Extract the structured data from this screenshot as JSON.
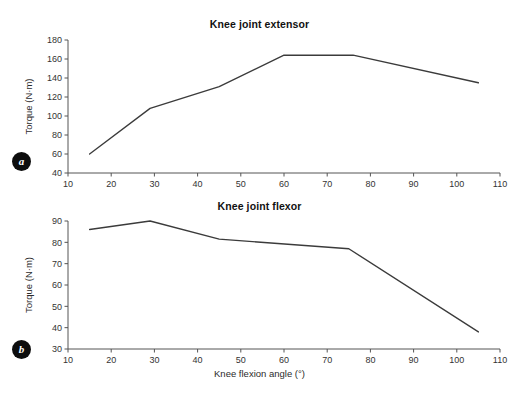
{
  "figure": {
    "background": "#ffffff",
    "line_color": "#3b3b3b",
    "axis_color": "#545454",
    "shared_xlabel": "Knee flexion angle (°)"
  },
  "panels": [
    {
      "id": "a",
      "badge": "a",
      "title": "Knee joint extensor"
    },
    {
      "id": "b",
      "badge": "b",
      "title": "Knee joint flexor"
    }
  ],
  "chart_data": [
    {
      "type": "line",
      "title": "Knee joint extensor",
      "panel_label": "a",
      "xlabel": "",
      "ylabel": "Torque (N·m)",
      "xlim": [
        10,
        110
      ],
      "ylim": [
        40,
        180
      ],
      "xticks": [
        10,
        20,
        30,
        40,
        50,
        60,
        70,
        80,
        90,
        100,
        110
      ],
      "yticks": [
        40,
        60,
        80,
        100,
        120,
        140,
        160,
        180
      ],
      "grid": false,
      "legend": "none",
      "series": [
        {
          "name": "Knee joint extensor torque",
          "x": [
            15,
            29,
            45,
            60,
            76,
            105
          ],
          "values": [
            60,
            108,
            131,
            164,
            164,
            135
          ]
        }
      ]
    },
    {
      "type": "line",
      "title": "Knee joint flexor",
      "panel_label": "b",
      "xlabel": "Knee flexion angle (°)",
      "ylabel": "Torque (N·m)",
      "xlim": [
        10,
        110
      ],
      "ylim": [
        30,
        90
      ],
      "xticks": [
        10,
        20,
        30,
        40,
        50,
        60,
        70,
        80,
        90,
        100,
        110
      ],
      "yticks": [
        30,
        40,
        50,
        60,
        70,
        80,
        90
      ],
      "grid": false,
      "legend": "none",
      "series": [
        {
          "name": "Knee joint flexor torque",
          "x": [
            15,
            29,
            45,
            75,
            105
          ],
          "values": [
            86,
            90,
            81.5,
            77,
            38
          ]
        }
      ]
    }
  ]
}
